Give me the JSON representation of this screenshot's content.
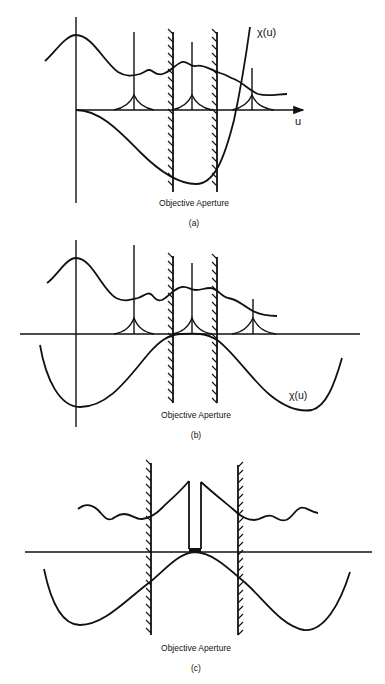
{
  "figure": {
    "panels": [
      {
        "id": "a",
        "caption": "(a)",
        "aperture_label": "Objective Aperture",
        "axis_label": "u",
        "curve_label": "χ(u)"
      },
      {
        "id": "b",
        "caption": "(b)",
        "aperture_label": "Objective Aperture",
        "curve_label": "χ(u)"
      },
      {
        "id": "c",
        "caption": "(c)",
        "aperture_label": "Objective Aperture"
      }
    ]
  }
}
